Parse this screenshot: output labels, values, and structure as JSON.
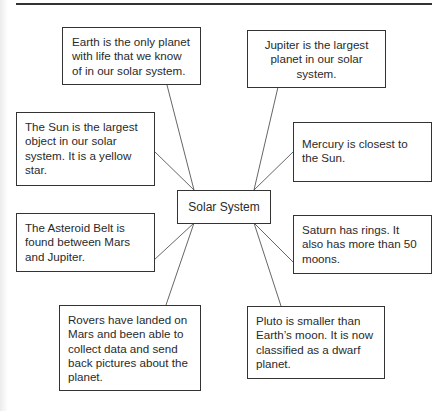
{
  "diagram": {
    "type": "concept-web",
    "center": {
      "label": "Solar System"
    },
    "facts": {
      "earth": "Earth is the only planet with life that we know of in our solar system.",
      "jupiter": "Jupiter is the largest planet in our solar system.",
      "sun": "The Sun is the largest object in our solar system. It is a yellow star.",
      "mercury": "Mercury is closest to the Sun.",
      "asteroid": "The Asteroid Belt is found between Mars and Jupiter.",
      "saturn": "Saturn has rings. It also has more than 50 moons.",
      "rovers": "Rovers have landed on Mars and been able to collect data and send back pictures about the planet.",
      "pluto": "Pluto is smaller than Earth’s moon. It is now classified as a dwarf planet."
    },
    "colors": {
      "border": "#333333",
      "text": "#2a2a2a",
      "background": "#ffffff"
    }
  }
}
